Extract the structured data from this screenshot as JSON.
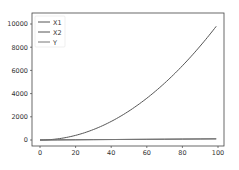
{
  "chart_data": {
    "type": "line",
    "title": "",
    "xlabel": "",
    "ylabel": "",
    "xlim": [
      -5,
      104
    ],
    "ylim": [
      -500,
      10300
    ],
    "grid": false,
    "legend_position": "upper left",
    "x_ticks": [
      0,
      20,
      40,
      60,
      80,
      100
    ],
    "x_tick_labels": [
      "0",
      "20",
      "40",
      "60",
      "80",
      "100"
    ],
    "y_ticks": [
      0,
      2000,
      4000,
      6000,
      8000,
      10000
    ],
    "y_tick_labels": [
      "0",
      "2000",
      "4000",
      "6000",
      "8000",
      "10000"
    ],
    "x": [
      0,
      10,
      20,
      30,
      40,
      50,
      60,
      70,
      80,
      90,
      99
    ],
    "series": [
      {
        "name": "X1",
        "color": "#555555",
        "values": [
          0,
          10,
          20,
          30,
          40,
          50,
          60,
          70,
          80,
          90,
          99
        ]
      },
      {
        "name": "X2",
        "color": "#555555",
        "values": [
          0,
          100,
          400,
          900,
          1600,
          2500,
          3600,
          4900,
          6400,
          8100,
          9801
        ]
      },
      {
        "name": "Y",
        "color": "#777777",
        "values": [
          0,
          10,
          20,
          30,
          40,
          50,
          60,
          70,
          80,
          90,
          99
        ]
      }
    ]
  },
  "legend": {
    "items": [
      {
        "label": "X1"
      },
      {
        "label": "X2"
      },
      {
        "label": "Y"
      }
    ]
  },
  "axes": {
    "x_tick_labels": [
      "0",
      "20",
      "40",
      "60",
      "80",
      "100"
    ],
    "y_tick_labels": [
      "0",
      "2000",
      "4000",
      "6000",
      "8000",
      "10000"
    ]
  }
}
